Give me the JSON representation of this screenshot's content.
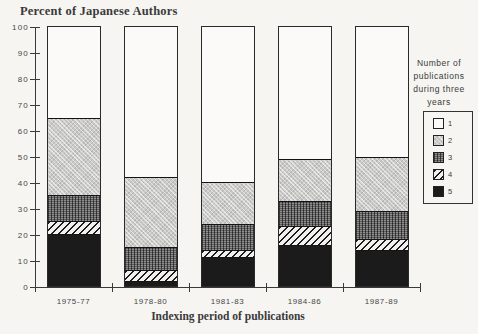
{
  "title": "Percent of Japanese Authors",
  "x_axis": {
    "label": "Indexing period of publications",
    "categories": [
      "1975-77",
      "1978-80",
      "1981-83",
      "1984-86",
      "1987-89"
    ]
  },
  "y_axis": {
    "ticks": [
      0,
      10,
      20,
      30,
      40,
      50,
      60,
      70,
      80,
      90,
      100
    ]
  },
  "legend": {
    "title_lines": [
      "Number of",
      "publications",
      "during three",
      "years"
    ],
    "items": [
      {
        "label": "1",
        "pattern": "white"
      },
      {
        "label": "2",
        "pattern": "light-halftone"
      },
      {
        "label": "3",
        "pattern": "dark-halftone"
      },
      {
        "label": "4",
        "pattern": "diagonal-hatch"
      },
      {
        "label": "5",
        "pattern": "black"
      }
    ]
  },
  "chart_data": {
    "type": "bar",
    "stacked": true,
    "unit": "percent",
    "title": "Percent of Japanese Authors",
    "xlabel": "Indexing period of publications",
    "ylabel": "Percent of Japanese Authors",
    "ylim": [
      0,
      100
    ],
    "yticks": [
      0,
      10,
      20,
      30,
      40,
      50,
      60,
      70,
      80,
      90,
      100
    ],
    "grid": false,
    "legend_position": "right",
    "categories": [
      "1975-77",
      "1978-80",
      "1981-83",
      "1984-86",
      "1987-89"
    ],
    "series": [
      {
        "name": "1",
        "values": [
          35,
          58,
          60,
          51,
          50
        ]
      },
      {
        "name": "2",
        "values": [
          30,
          27,
          16,
          16,
          21
        ]
      },
      {
        "name": "3",
        "values": [
          10,
          9,
          10,
          10,
          11
        ]
      },
      {
        "name": "4",
        "values": [
          5,
          4,
          3,
          7,
          4
        ]
      },
      {
        "name": "5",
        "values": [
          20,
          2,
          11,
          16,
          14
        ]
      }
    ]
  },
  "colors": {
    "background": "#f6f5f2",
    "ink": "#3a3a3a",
    "fill_light_gray": "#cacac8",
    "fill_dark_gray": "#5e5e5e",
    "fill_black": "#1b1b1b",
    "fill_white": "#fbfaf8"
  }
}
